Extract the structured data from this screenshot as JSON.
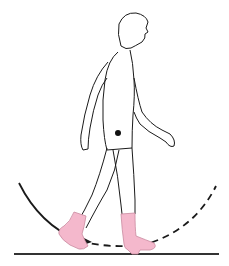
{
  "figure": {
    "description": "Side view of a walking person wearing pink boots; a dot marks the center of mass; a circular arc (solid then dashed with an arrowhead) sweeps beneath the feet above a ground line",
    "colors": {
      "outline": "#1a1a1a",
      "boot_fill": "#f4b8cc",
      "boot_stroke": "#c98aa0",
      "ground": "#333333",
      "background": "#ffffff"
    },
    "elements": {
      "figure": "walking-person",
      "center_of_mass": "dot",
      "arc": "rotation-path",
      "ground": "floor-line"
    }
  }
}
